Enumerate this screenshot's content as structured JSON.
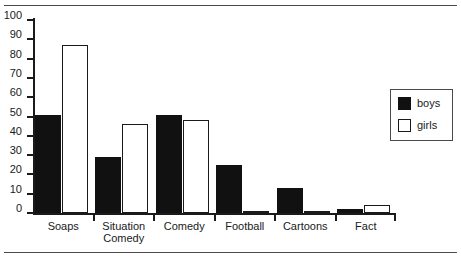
{
  "chart_data": {
    "type": "bar",
    "title": "",
    "subtitle": "",
    "xlabel": "",
    "ylabel": "",
    "ylim": [
      0,
      100
    ],
    "ytick_step": 10,
    "yticks": [
      0,
      10,
      20,
      30,
      40,
      50,
      60,
      70,
      80,
      90,
      100
    ],
    "ytick_labels": [
      "0",
      "10",
      "20",
      "30",
      "40",
      "50",
      "60",
      "70",
      "80",
      "90",
      "100"
    ],
    "grid": false,
    "legend_position": "right",
    "categories": [
      "Soaps",
      "Situation\nComedy",
      "Comedy",
      "Football",
      "Cartoons",
      "Fact"
    ],
    "series": [
      {
        "name": "boys",
        "color": "#111111",
        "values": [
          51,
          29,
          51,
          25,
          13,
          2
        ]
      },
      {
        "name": "girls",
        "color": "#ffffff",
        "values": [
          87,
          46,
          48,
          1,
          1,
          4
        ]
      }
    ]
  },
  "legend": {
    "entries": [
      {
        "label": "boys",
        "swatch": "filled-black-square"
      },
      {
        "label": "girls",
        "swatch": "outlined-white-square"
      }
    ]
  },
  "figure": {
    "rule_color": "#4a4a4a",
    "axis_color": "#1a1a1a"
  }
}
